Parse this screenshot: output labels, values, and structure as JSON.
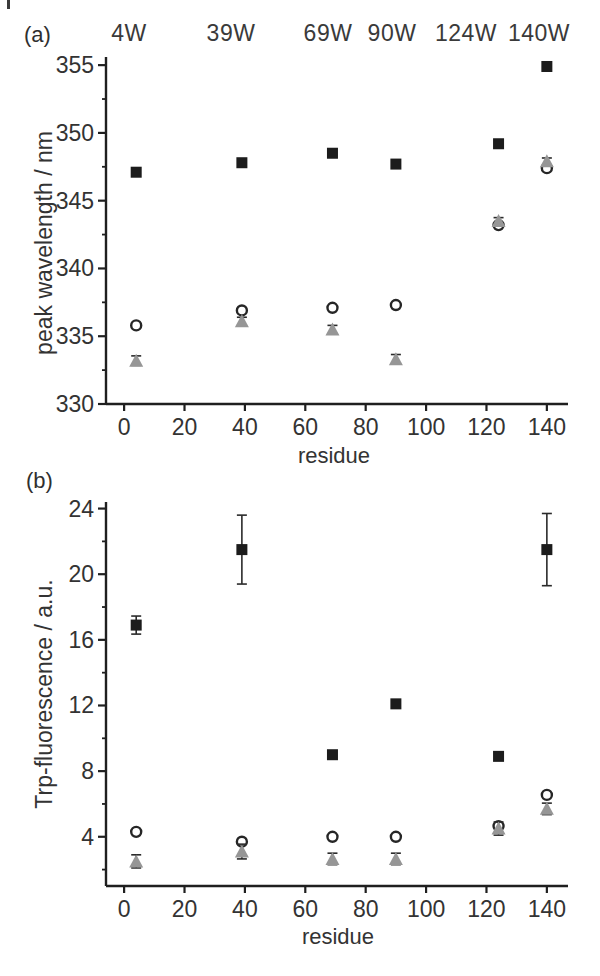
{
  "figure": {
    "panel_a_label": "(a)",
    "panel_b_label": "(b)",
    "top_labels": [
      {
        "label": "4W",
        "x": 129
      },
      {
        "label": "39W",
        "x": 231
      },
      {
        "label": "69W",
        "x": 328
      },
      {
        "label": "90W",
        "x": 392
      },
      {
        "label": "124W",
        "x": 466
      },
      {
        "label": "140W",
        "x": 539
      }
    ],
    "background": "#ffffff",
    "text_color": "#333333",
    "axis_color": "#1f1f1f"
  },
  "chart_data": [
    {
      "id": "a",
      "panel": "(a)",
      "type": "scatter",
      "title": "",
      "xlabel": "residue",
      "ylabel": "peak wavelength / nm",
      "xlim": [
        -6,
        147
      ],
      "ylim": [
        330,
        355.6
      ],
      "xticks": [
        0,
        20,
        40,
        60,
        80,
        100,
        120,
        140
      ],
      "yticks": [
        330,
        335,
        340,
        345,
        350,
        355
      ],
      "yminorticks": [
        332.5,
        337.5,
        342.5,
        347.5,
        352.5
      ],
      "grid": false,
      "legend": "none",
      "x": [
        4,
        39,
        69,
        90,
        124,
        140
      ],
      "series": [
        {
          "name": "filled-square",
          "marker": "square",
          "color": "#1c1c1c",
          "values": [
            347.1,
            347.8,
            348.5,
            347.7,
            349.2,
            354.9
          ]
        },
        {
          "name": "open-circle",
          "marker": "open-circle",
          "color": "#262626",
          "values": [
            335.8,
            336.9,
            337.1,
            337.3,
            343.2,
            347.4
          ]
        },
        {
          "name": "gray-triangle",
          "marker": "triangle",
          "color": "#969696",
          "values": [
            333.2,
            336.1,
            335.5,
            333.3,
            343.5,
            347.9
          ],
          "yerr": [
            0.35,
            0.3,
            0.3,
            0.35,
            0.25,
            0.25
          ]
        }
      ]
    },
    {
      "id": "b",
      "panel": "(b)",
      "type": "scatter",
      "title": "",
      "xlabel": "residue",
      "ylabel": "Trp-fluorescence / a.u.",
      "xlim": [
        -6,
        147
      ],
      "ylim": [
        1,
        24.4
      ],
      "xticks": [
        0,
        20,
        40,
        60,
        80,
        100,
        120,
        140
      ],
      "yticks": [
        4,
        8,
        12,
        16,
        20,
        24
      ],
      "yminorticks": [
        2,
        6,
        10,
        14,
        18,
        22
      ],
      "grid": false,
      "legend": "none",
      "x": [
        4,
        39,
        69,
        90,
        124,
        140
      ],
      "series": [
        {
          "name": "filled-square",
          "marker": "square",
          "color": "#1c1c1c",
          "values": [
            16.9,
            21.5,
            9.0,
            12.1,
            8.9,
            21.5
          ],
          "yerr": [
            0.55,
            2.1,
            0,
            0,
            0,
            2.2
          ]
        },
        {
          "name": "open-circle",
          "marker": "open-circle",
          "color": "#262626",
          "values": [
            4.3,
            3.7,
            4.0,
            4.0,
            4.65,
            6.55
          ]
        },
        {
          "name": "gray-triangle",
          "marker": "triangle",
          "color": "#969696",
          "values": [
            2.5,
            3.1,
            2.65,
            2.65,
            4.5,
            5.7
          ],
          "yerr": [
            0.4,
            0.45,
            0.35,
            0.35,
            0.4,
            0.35
          ]
        }
      ]
    }
  ]
}
